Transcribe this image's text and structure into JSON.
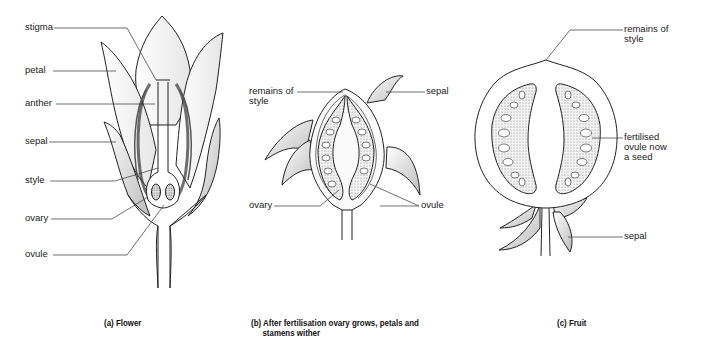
{
  "figure": {
    "panels": [
      {
        "id": "a",
        "caption": "(a) Flower",
        "labels": [
          "stigma",
          "petal",
          "anther",
          "sepal",
          "style",
          "ovary",
          "ovule"
        ]
      },
      {
        "id": "b",
        "caption_line1": "(b) After fertilisation ovary grows, petals and",
        "caption_line2": "stamens wither",
        "labels": {
          "remains_of_style_1": "remains of",
          "remains_of_style_2": "style",
          "sepal": "sepal",
          "ovary": "ovary",
          "ovule": "ovule"
        }
      },
      {
        "id": "c",
        "caption": "(c) Fruit",
        "labels": {
          "remains_of_style_1": "remains of",
          "remains_of_style_2": "style",
          "seed_1": "fertilised",
          "seed_2": "ovule now",
          "seed_3": "a seed",
          "sepal": "sepal"
        }
      }
    ]
  }
}
